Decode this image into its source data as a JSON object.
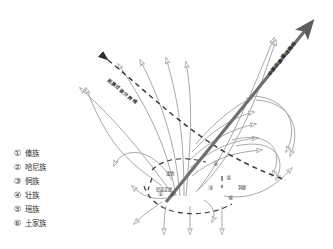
{
  "figure": {
    "title": "",
    "background_color": "#ffffff",
    "thick_arrow_color": "#6f6f6f",
    "thin_arrow_color": "#9a9a9a",
    "dashed_line_color": "#3a3a3a"
  },
  "legend": {
    "items": [
      {
        "marker": "①",
        "label": "傣族"
      },
      {
        "marker": "②",
        "label": "哈尼族"
      },
      {
        "marker": "③",
        "label": "侗族"
      },
      {
        "marker": "④",
        "label": "壮族"
      },
      {
        "marker": "⑤",
        "label": "瑶族"
      },
      {
        "marker": "⑥",
        "label": "土家族"
      }
    ]
  },
  "annotations": {
    "main_route": "中原汉族南迁路线",
    "dashed_route": "民族迁徙分界线",
    "node_labels": [
      {
        "text": "滇池",
        "x": 168,
        "y": 173
      },
      {
        "text": "民族走廊",
        "x": 160,
        "y": 188
      },
      {
        "text": "洞庭",
        "x": 240,
        "y": 186
      }
    ],
    "node_numbers": [
      {
        "marker": "①",
        "x": 160,
        "y": 194
      },
      {
        "marker": "②",
        "x": 172,
        "y": 194
      },
      {
        "marker": "③",
        "x": 210,
        "y": 188
      },
      {
        "marker": "④",
        "x": 215,
        "y": 164
      },
      {
        "marker": "⑤",
        "x": 228,
        "y": 178
      },
      {
        "marker": "⑥",
        "x": 230,
        "y": 198
      }
    ]
  }
}
